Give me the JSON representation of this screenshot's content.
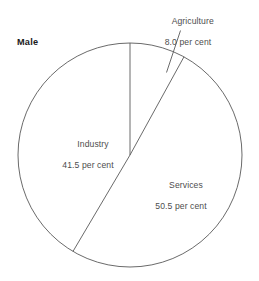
{
  "chart_data": {
    "type": "pie",
    "title": "Male",
    "xlabel": "",
    "ylabel": "",
    "unit": "per cent",
    "categories": [
      "Agriculture",
      "Industry",
      "Services"
    ],
    "values": [
      8.0,
      41.5,
      50.5
    ],
    "value_labels": [
      "8.0 per cent",
      "41.5 per cent",
      "50.5 per cent"
    ],
    "legend": "none",
    "grid": false,
    "start_angle_deg": 0,
    "direction": "clockwise",
    "slices": [
      {
        "name": "Agriculture",
        "value": 8.0,
        "label_line1": "Agriculture",
        "label_line2": "8.0 per cent",
        "label_placement": "outside-with-leader",
        "fill": "#ffffff",
        "stroke": "#595959"
      },
      {
        "name": "Industry",
        "value": 41.5,
        "label_line1": "Industry",
        "label_line2": "41.5 per cent",
        "label_placement": "inside",
        "fill": "#ffffff",
        "stroke": "#595959"
      },
      {
        "name": "Services",
        "value": 50.5,
        "label_line1": "Services",
        "label_line2": "50.5 per cent",
        "label_placement": "inside",
        "fill": "#ffffff",
        "stroke": "#595959"
      }
    ]
  },
  "colors": {
    "background": "#ffffff",
    "outline": "#595959",
    "label_text": "#4d4d4d",
    "title_text": "#1a1a1a"
  }
}
